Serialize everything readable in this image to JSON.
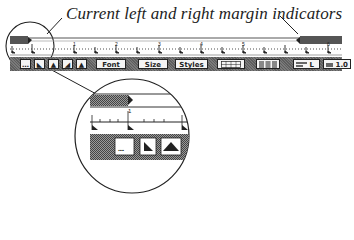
{
  "caption": {
    "text": "Current left and right margin indicators"
  },
  "ruler": {
    "numbers": [
      "1",
      "2",
      "3",
      "4",
      "5",
      "6"
    ],
    "left_margin_indicator": "left-margin",
    "right_margin_indicator": "right-margin"
  },
  "toolbar": {
    "icon_buttons": [
      {
        "name": "line-spacing-dotted",
        "glyph": "…"
      },
      {
        "name": "left-tab",
        "glyph": "◣"
      },
      {
        "name": "center-tab",
        "glyph": "▲"
      },
      {
        "name": "right-tab",
        "glyph": "◢"
      },
      {
        "name": "decimal-tab",
        "glyph": "▲"
      }
    ],
    "font_label": "Font",
    "size_label": "Size",
    "styles_label": "Styles",
    "table_icon": "grid-icon",
    "columns_icon": "columns-icon",
    "justify_label": "L",
    "spacing_label": "1.0"
  },
  "magnifier": {
    "label": "magnified-margin-detail",
    "ruler_number": "1",
    "buttons": [
      "....",
      "◣",
      "▲"
    ]
  },
  "colors": {
    "dark": "#555555",
    "light": "#f4f4f4",
    "line": "#222222"
  }
}
